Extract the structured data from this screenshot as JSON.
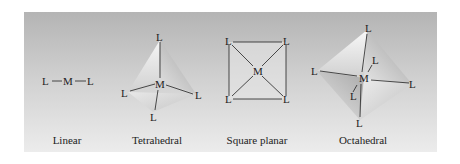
{
  "figure": {
    "geometries": [
      {
        "id": "linear",
        "caption": "Linear",
        "center_atom": "M",
        "ligand": "L"
      },
      {
        "id": "tetrahedral",
        "caption": "Tetrahedral",
        "center_atom": "M",
        "ligand": "L"
      },
      {
        "id": "square-planar",
        "caption": "Square planar",
        "center_atom": "M",
        "ligand": "L"
      },
      {
        "id": "octahedral",
        "caption": "Octahedral",
        "center_atom": "M",
        "ligand": "L"
      }
    ],
    "colors": {
      "background_top": "#b4b4b4",
      "background_bottom": "#ececec",
      "line": "#222222"
    }
  }
}
